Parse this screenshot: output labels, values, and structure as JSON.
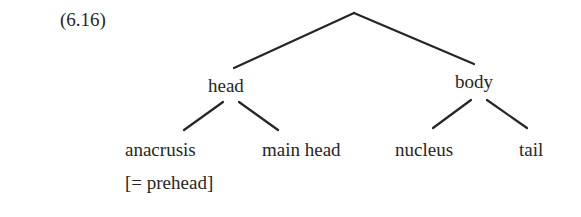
{
  "example_number": "(6.16)",
  "tree": {
    "root": "",
    "nodes": {
      "head": "head",
      "body": "body",
      "anacrusis": "anacrusis",
      "anacrusis_gloss": "[= prehead]",
      "main_head": "main head",
      "nucleus": "nucleus",
      "tail": "tail"
    },
    "edges": [
      [
        "root",
        "head"
      ],
      [
        "root",
        "body"
      ],
      [
        "head",
        "anacrusis"
      ],
      [
        "head",
        "main head"
      ],
      [
        "body",
        "nucleus"
      ],
      [
        "body",
        "tail"
      ]
    ]
  }
}
